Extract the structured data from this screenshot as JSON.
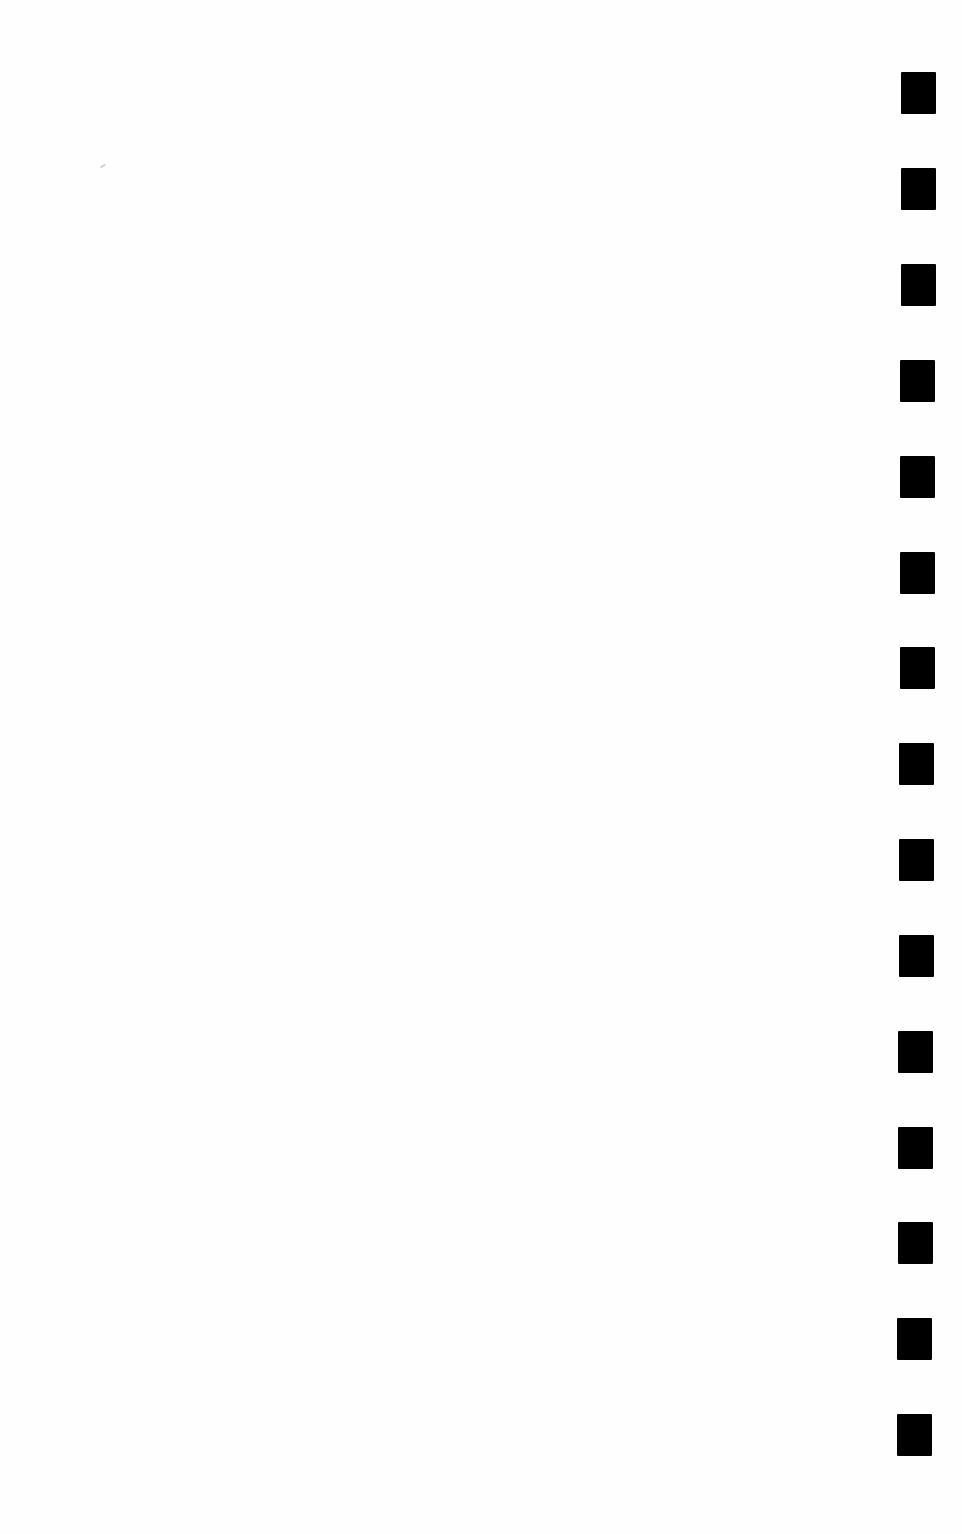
{
  "page": {
    "type": "blank-scanned-page",
    "background_color": "#fefefe",
    "text": ""
  },
  "registration_marks": {
    "count": 15,
    "color": "#000000",
    "width": 35,
    "height": 42,
    "items": [
      {
        "x": 901,
        "y": 72
      },
      {
        "x": 901,
        "y": 168
      },
      {
        "x": 901,
        "y": 264
      },
      {
        "x": 900,
        "y": 360
      },
      {
        "x": 900,
        "y": 456
      },
      {
        "x": 900,
        "y": 552
      },
      {
        "x": 900,
        "y": 647
      },
      {
        "x": 899,
        "y": 743
      },
      {
        "x": 899,
        "y": 839
      },
      {
        "x": 899,
        "y": 935
      },
      {
        "x": 898,
        "y": 1031
      },
      {
        "x": 898,
        "y": 1127
      },
      {
        "x": 898,
        "y": 1222
      },
      {
        "x": 897,
        "y": 1318
      },
      {
        "x": 897,
        "y": 1414
      }
    ]
  }
}
